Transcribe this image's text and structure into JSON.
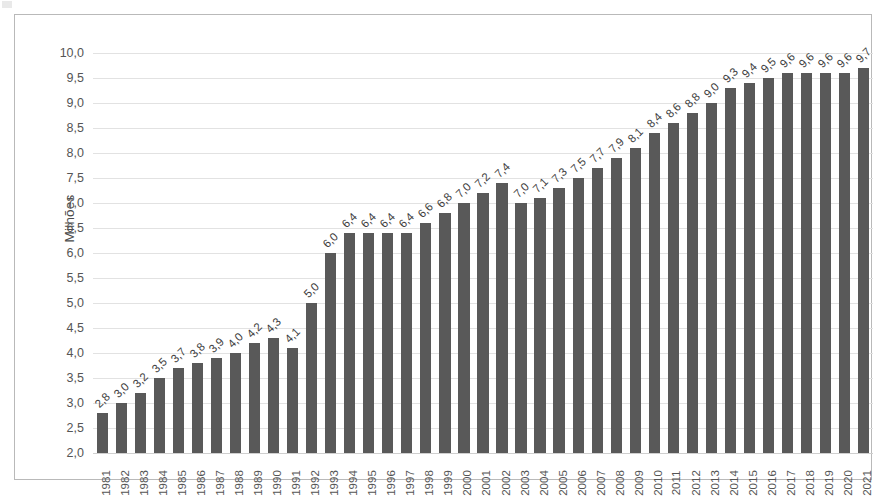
{
  "chart_data": {
    "type": "bar",
    "title": "",
    "subtitle": "",
    "xlabel": "",
    "ylabel": "Milhões",
    "ylim": [
      2.0,
      10.0
    ],
    "ytick_step": 0.5,
    "grid": true,
    "legend": false,
    "decimal_separator": ",",
    "bar_color": "#595959",
    "gridline_color": "#e2e2e2",
    "frame_color": "#b9b9b9",
    "data_labels_rotation_deg": -45,
    "xtick_labels_rotation_deg": -90,
    "ytick_labels": [
      "2,0",
      "2,5",
      "3,0",
      "3,5",
      "4,0",
      "4,5",
      "5,0",
      "5,5",
      "6,0",
      "6,5",
      "7,0",
      "7,5",
      "8,0",
      "8,5",
      "9,0",
      "9,5",
      "10,0"
    ],
    "categories": [
      "1981",
      "1982",
      "1983",
      "1984",
      "1985",
      "1986",
      "1987",
      "1988",
      "1989",
      "1990",
      "1991",
      "1992",
      "1993",
      "1994",
      "1995",
      "1996",
      "1997",
      "1998",
      "1999",
      "2000",
      "2001",
      "2002",
      "2003",
      "2004",
      "2005",
      "2006",
      "2007",
      "2008",
      "2009",
      "2010",
      "2011",
      "2012",
      "2013",
      "2014",
      "2015",
      "2016",
      "2017",
      "2018",
      "2019",
      "2020",
      "2021"
    ],
    "values": [
      2.8,
      3.0,
      3.2,
      3.5,
      3.7,
      3.8,
      3.9,
      4.0,
      4.2,
      4.3,
      4.1,
      5.0,
      6.0,
      6.4,
      6.4,
      6.4,
      6.4,
      6.6,
      6.8,
      7.0,
      7.2,
      7.4,
      7.0,
      7.1,
      7.3,
      7.5,
      7.7,
      7.9,
      8.1,
      8.4,
      8.6,
      8.8,
      9.0,
      9.3,
      9.4,
      9.5,
      9.6,
      9.6,
      9.6,
      9.6,
      9.7
    ],
    "value_labels": [
      "2,8",
      "3,0",
      "3,2",
      "3,5",
      "3,7",
      "3,8",
      "3,9",
      "4,0",
      "4,2",
      "4,3",
      "4,1",
      "5,0",
      "6,0",
      "6,4",
      "6,4",
      "6,4",
      "6,4",
      "6,6",
      "6,8",
      "7,0",
      "7,2",
      "7,4",
      "7,0",
      "7,1",
      "7,3",
      "7,5",
      "7,7",
      "7,9",
      "8,1",
      "8,4",
      "8,6",
      "8,8",
      "9,0",
      "9,3",
      "9,4",
      "9,5",
      "9,6",
      "9,6",
      "9,6",
      "9,6",
      "9,7"
    ]
  }
}
